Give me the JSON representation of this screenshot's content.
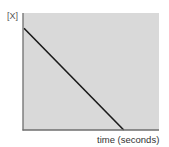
{
  "chart_data": {
    "type": "line",
    "title": "",
    "xlabel": "time (seconds)",
    "ylabel": "[X]",
    "x": [
      0,
      1
    ],
    "series": [
      {
        "name": "[X]",
        "values": [
          1,
          0
        ],
        "color": "#1a1a1a"
      }
    ],
    "xlim": [
      0,
      1.35
    ],
    "ylim": [
      0,
      1.15
    ],
    "grid": false,
    "legend": null,
    "plot_background": "#d9d9d9",
    "axis_color": "#666666",
    "annotations": []
  },
  "labels": {
    "ylabel": "[X]",
    "xlabel": "time (seconds)"
  }
}
